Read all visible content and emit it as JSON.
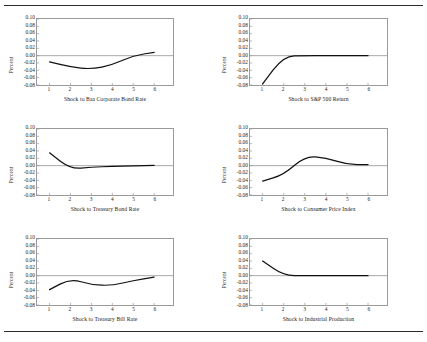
{
  "figure": {
    "ylabel": "Percent",
    "y_ticks": [
      "0.10",
      "0.08",
      "0.06",
      "0.04",
      "0.02",
      "0.00",
      "-0.02",
      "-0.04",
      "-0.06",
      "-0.08"
    ],
    "x_ticks": [
      "1",
      "2",
      "3",
      "4",
      "5",
      "6"
    ],
    "line_color": "#111111",
    "frame_color": "#9a9a9a",
    "zero_line_color": "#8f8f8f"
  },
  "chart_data": [
    {
      "type": "line",
      "title": "Shock to Baa Corporate Bond Rate",
      "xlabel": "Shock to Baa Corporate Bond Rate",
      "ylabel": "Percent",
      "x": [
        1,
        2,
        3,
        4,
        5,
        6
      ],
      "values": [
        -0.017,
        -0.031,
        -0.037,
        -0.025,
        0.0,
        0.009
      ],
      "ylim": [
        -0.08,
        0.1
      ],
      "xlim": [
        0.4,
        6.9
      ],
      "yticks": [
        0.1,
        0.08,
        0.06,
        0.04,
        0.02,
        0.0,
        -0.02,
        -0.04,
        -0.06,
        -0.08
      ],
      "grid": false,
      "legend": "none"
    },
    {
      "type": "line",
      "title": "Shock to S&P 500 Return",
      "xlabel": "Shock to S&P 500 Return",
      "ylabel": "Percent",
      "x": [
        1,
        2,
        3,
        4,
        5,
        6
      ],
      "values": [
        -0.077,
        -0.001,
        0.0,
        0.0,
        0.0,
        0.0
      ],
      "ylim": [
        -0.08,
        0.1
      ],
      "xlim": [
        0.4,
        6.9
      ],
      "yticks": [
        0.1,
        0.08,
        0.06,
        0.04,
        0.02,
        0.0,
        -0.02,
        -0.04,
        -0.06,
        -0.08
      ],
      "grid": false,
      "legend": "none"
    },
    {
      "type": "line",
      "title": "Shock to Treasury Bond Rate",
      "xlabel": "Shock to Treasury Bond Rate",
      "ylabel": "Percent",
      "x": [
        1,
        2,
        3,
        4,
        5,
        6
      ],
      "values": [
        0.035,
        -0.009,
        -0.004,
        -0.002,
        -0.001,
        0.001
      ],
      "ylim": [
        -0.08,
        0.1
      ],
      "xlim": [
        0.4,
        6.9
      ],
      "yticks": [
        0.1,
        0.08,
        0.06,
        0.04,
        0.02,
        0.0,
        -0.02,
        -0.04,
        -0.06,
        -0.08
      ],
      "grid": false,
      "legend": "none"
    },
    {
      "type": "line",
      "title": "Shock to Consumer Price Index",
      "xlabel": "Shock to Consumer Price Index",
      "ylabel": "Percent",
      "x": [
        1,
        2,
        3,
        4,
        5,
        6
      ],
      "values": [
        -0.042,
        -0.025,
        0.026,
        0.022,
        0.003,
        0.003
      ],
      "ylim": [
        -0.08,
        0.1
      ],
      "xlim": [
        0.4,
        6.9
      ],
      "yticks": [
        0.1,
        0.08,
        0.06,
        0.04,
        0.02,
        0.0,
        -0.02,
        -0.04,
        -0.06,
        -0.08
      ],
      "grid": false,
      "legend": "none"
    },
    {
      "type": "line",
      "title": "Shock to Treasury Bill Rate",
      "xlabel": "Shock to Treasury Bill Rate",
      "ylabel": "Percent",
      "x": [
        1,
        2,
        3,
        4,
        5,
        6
      ],
      "values": [
        -0.038,
        -0.008,
        -0.025,
        -0.027,
        -0.013,
        -0.004
      ],
      "ylim": [
        -0.08,
        0.1
      ],
      "xlim": [
        0.4,
        6.9
      ],
      "yticks": [
        0.1,
        0.08,
        0.06,
        0.04,
        0.02,
        0.0,
        -0.02,
        -0.04,
        -0.06,
        -0.08
      ],
      "grid": false,
      "legend": "none"
    },
    {
      "type": "line",
      "title": "Shock to Industrial Production",
      "xlabel": "Shock to Industrial Production",
      "ylabel": "Percent",
      "x": [
        1,
        2,
        3,
        4,
        5,
        6
      ],
      "values": [
        0.04,
        0.0,
        0.0,
        0.0,
        0.0,
        0.0
      ],
      "ylim": [
        -0.08,
        0.1
      ],
      "xlim": [
        0.4,
        6.9
      ],
      "yticks": [
        0.1,
        0.08,
        0.06,
        0.04,
        0.02,
        0.0,
        -0.02,
        -0.04,
        -0.06,
        -0.08
      ],
      "grid": false,
      "legend": "none"
    }
  ]
}
